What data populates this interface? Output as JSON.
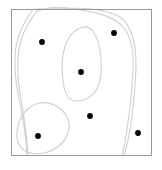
{
  "figure": {
    "type": "point-contour-diagram",
    "width": 162,
    "height": 170,
    "background_color": "#ffffff",
    "title": "",
    "caption": ""
  },
  "frame": {
    "label": "plot-border",
    "x": 11.5,
    "y": 9.5,
    "width": 140,
    "height": 146,
    "stroke_color": "#9a9a9a",
    "stroke_width": 1,
    "fill": "none"
  },
  "contours": {
    "stroke_color": "#cfcfcf",
    "stroke_width": 1.1,
    "fill": "none",
    "count": 3,
    "items": [
      {
        "name": "outer-region-contour",
        "description": "large clipped contour spanning most of the frame",
        "path": "M 33 9.5 C 24 22, 16 36, 15 56 C 14 74, 17 90, 20 104 C 23 118, 26 136, 27 155.5 L 28 155.5 C 27 136, 24 118, 22 104 C 19 90, 17 74, 18 57 C 19 38, 27 24, 36 12 C 46 6, 60 7, 74 9 C 92 12, 112 14, 124 28 C 133 40, 134 56, 133 72 C 132 88, 131 104, 128 122 C 126 138, 124 148, 122 155.5 L 124 155.5 C 127 146, 130 132, 132 116 C 134 98, 136 80, 136 64 C 136 44, 132 26, 120 17 C 106 9, 86 8, 66 8 C 54 8, 42 8, 33 9.5 Z"
      },
      {
        "name": "middle-blob-contour",
        "description": "medium closed blob in the upper-middle area",
        "path": "M 84 27 C 74 29, 67 38, 64 50 C 61 62, 62 76, 64 87 C 66 96, 70 101, 76 101 C 84 101, 92 97, 97 89 C 101 81, 102 70, 101 58 C 100 46, 97 36, 92 30 C 89 27, 87 26.5, 84 27 Z"
      },
      {
        "name": "lower-left-blob-contour",
        "description": "oval closed blob in the lower-left area",
        "path": "M 40 103 C 29 105, 21 114, 18 126 C 15 138, 18 148, 27 152 C 37 156, 51 153, 60 145 C 68 138, 71 128, 68 119 C 64 109, 52 101, 40 103 Z"
      }
    ]
  },
  "points": {
    "name": "data-points",
    "color": "#000000",
    "radius": 2.9,
    "count": 6,
    "items": [
      {
        "name": "point-1",
        "x": 42,
        "y": 42
      },
      {
        "name": "point-2",
        "x": 114,
        "y": 33
      },
      {
        "name": "point-3",
        "x": 81,
        "y": 72
      },
      {
        "name": "point-4",
        "x": 90,
        "y": 116
      },
      {
        "name": "point-5",
        "x": 38,
        "y": 136
      },
      {
        "name": "point-6",
        "x": 138,
        "y": 133
      }
    ]
  }
}
